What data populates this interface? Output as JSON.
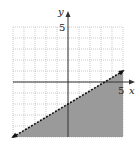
{
  "chart_data": {
    "type": "area",
    "title": "",
    "xlabel": "x",
    "ylabel": "y",
    "xlim": [
      -5,
      5
    ],
    "ylim": [
      -5,
      5
    ],
    "grid": true,
    "tick_labels": {
      "x": [
        "5"
      ],
      "y": [
        "5"
      ]
    },
    "boundary": {
      "style": "dashed",
      "equation": "y = (3/5)x - 2",
      "points": [
        [
          -5,
          -5
        ],
        [
          5,
          1
        ]
      ]
    },
    "shaded_region": "below",
    "colors": {
      "shade": "#9a9a9a",
      "grid": "#aaaaaa",
      "axis": "#333333",
      "boundary": "#111111"
    }
  },
  "labels": {
    "x_axis": "x",
    "y_axis": "y",
    "x_tick": "5",
    "y_tick": "5"
  }
}
